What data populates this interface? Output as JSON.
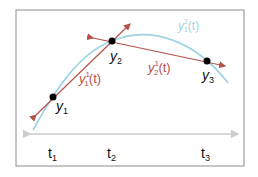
{
  "diagram": {
    "colors": {
      "frame": "#8a8a8a",
      "curve": "#9fd3e6",
      "tangent": "#b5524a",
      "axis": "#cccccc",
      "point": "#000000",
      "text": "#111111"
    },
    "points": [
      {
        "label": "y",
        "sub": "1"
      },
      {
        "label": "y",
        "sub": "2"
      },
      {
        "label": "y",
        "sub": "3"
      }
    ],
    "tangent_labels": [
      {
        "base": "y",
        "sup": "1",
        "sub": "1",
        "arg": "(t)"
      },
      {
        "base": "y",
        "sup": "1",
        "sub": "2",
        "arg": "(t)"
      }
    ],
    "curve_label": {
      "base": "y",
      "sup": "2",
      "sub": "1",
      "arg": "(t)"
    },
    "axis_ticks": [
      {
        "label": "t",
        "sub": "1"
      },
      {
        "label": "t",
        "sub": "2"
      },
      {
        "label": "t",
        "sub": "3"
      }
    ]
  }
}
